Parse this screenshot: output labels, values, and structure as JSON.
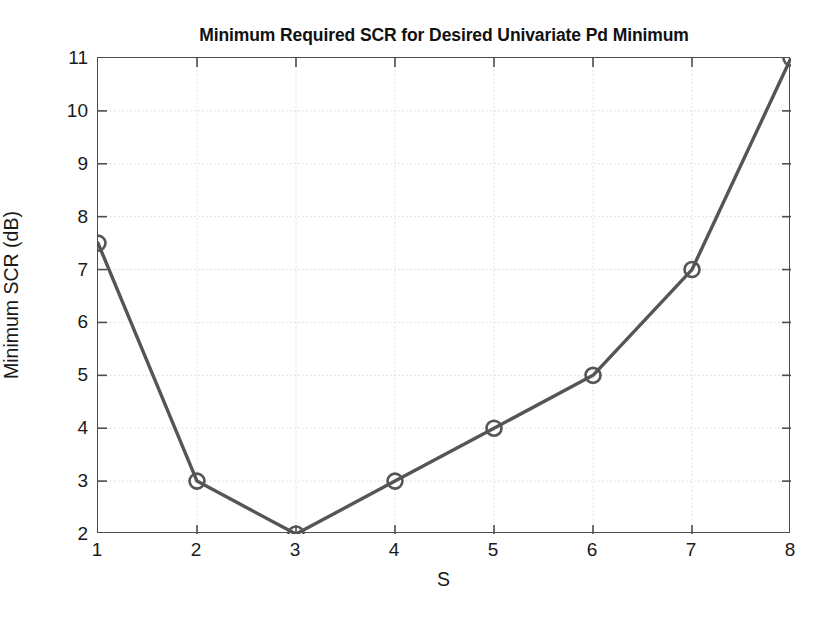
{
  "chart_data": {
    "type": "line",
    "title": "Minimum Required SCR for Desired Univariate Pd Minimum",
    "xlabel": "S",
    "ylabel": "Minimum SCR (dB)",
    "x": [
      1,
      2,
      3,
      4,
      5,
      6,
      7,
      8
    ],
    "values": [
      7.5,
      3,
      2,
      3,
      4,
      5,
      7,
      11
    ],
    "series": [
      {
        "name": "Minimum Required SCR",
        "values": [
          7.5,
          3,
          2,
          3,
          4,
          5,
          7,
          11
        ]
      }
    ],
    "xlim": [
      1,
      8
    ],
    "ylim": [
      2,
      11
    ],
    "xticks": [
      1,
      2,
      3,
      4,
      5,
      6,
      7,
      8
    ],
    "yticks": [
      2,
      3,
      4,
      5,
      6,
      7,
      8,
      9,
      10,
      11
    ],
    "xtick_labels": [
      "1",
      "2",
      "3",
      "4",
      "5",
      "6",
      "7",
      "8"
    ],
    "ytick_labels": [
      "2",
      "3",
      "4",
      "5",
      "6",
      "7",
      "8",
      "9",
      "10",
      "11"
    ],
    "grid": true,
    "grid_style": "dotted",
    "legend": false,
    "marker": "circle-open",
    "line_color": "#555555",
    "marker_color": "#555555",
    "grid_color": "#d8d8d8",
    "axis_color": "#4d4d4d",
    "background_color": "#ffffff"
  }
}
